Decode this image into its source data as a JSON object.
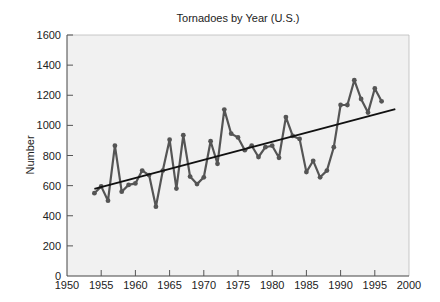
{
  "chart_data": {
    "type": "line",
    "title": "Tornadoes by Year (U.S.)",
    "xlabel": "",
    "ylabel": "Number",
    "xlim": [
      1950,
      2000
    ],
    "ylim": [
      0,
      1600
    ],
    "xticks": [
      1950,
      1955,
      1960,
      1965,
      1970,
      1975,
      1980,
      1985,
      1990,
      1995,
      2000
    ],
    "yticks": [
      0,
      200,
      400,
      600,
      800,
      1000,
      1200,
      1400,
      1600
    ],
    "grid": false,
    "legend": null,
    "series": [
      {
        "name": "Tornadoes",
        "style": "line-with-markers",
        "color": "#555555",
        "x": [
          1954,
          1955,
          1956,
          1957,
          1958,
          1959,
          1960,
          1961,
          1962,
          1963,
          1964,
          1965,
          1966,
          1967,
          1968,
          1969,
          1970,
          1971,
          1972,
          1973,
          1974,
          1975,
          1976,
          1977,
          1978,
          1979,
          1980,
          1981,
          1982,
          1983,
          1984,
          1985,
          1986,
          1987,
          1988,
          1989,
          1990,
          1991,
          1992,
          1993,
          1994,
          1995,
          1996
        ],
        "values": [
          550,
          595,
          500,
          865,
          560,
          605,
          615,
          700,
          670,
          460,
          700,
          905,
          580,
          935,
          660,
          610,
          655,
          895,
          745,
          1105,
          945,
          920,
          835,
          865,
          790,
          855,
          865,
          785,
          1055,
          930,
          910,
          690,
          765,
          655,
          700,
          855,
          1135,
          1135,
          1300,
          1175,
          1085,
          1245,
          1160
        ]
      },
      {
        "name": "Trend",
        "style": "line",
        "color": "#111111",
        "x": [
          1954,
          1998
        ],
        "values": [
          578,
          1108
        ]
      }
    ]
  }
}
